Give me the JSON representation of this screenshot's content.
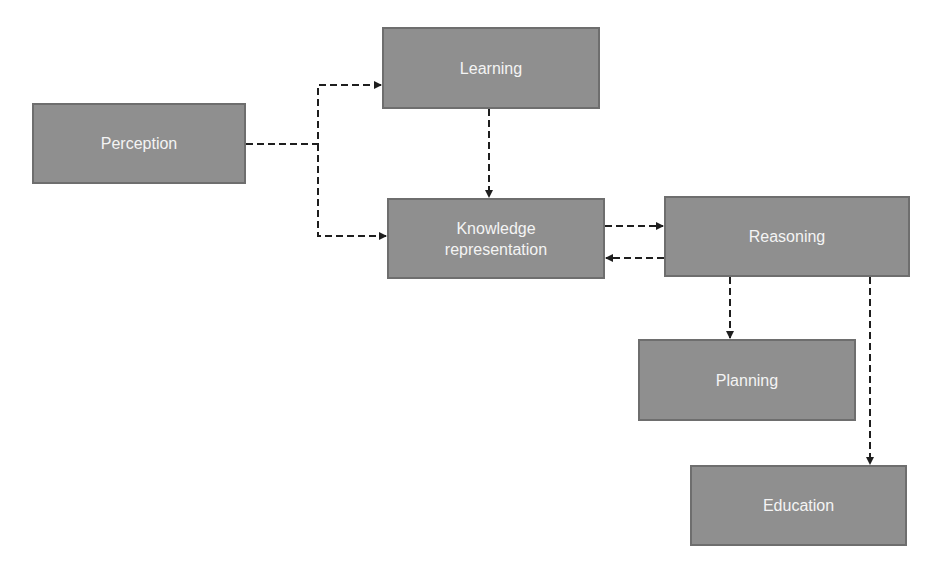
{
  "diagram": {
    "nodes": [
      {
        "id": "perception",
        "label": "Perception"
      },
      {
        "id": "learning",
        "label": "Learning"
      },
      {
        "id": "knowledge_representation",
        "label": "Knowledge\nrepresentation"
      },
      {
        "id": "reasoning",
        "label": "Reasoning"
      },
      {
        "id": "planning",
        "label": "Planning"
      },
      {
        "id": "education",
        "label": "Education"
      }
    ],
    "edges": [
      {
        "from": "Perception",
        "to": "Learning",
        "style": "dashed"
      },
      {
        "from": "Perception",
        "to": "Knowledge representation",
        "style": "dashed"
      },
      {
        "from": "Learning",
        "to": "Knowledge representation",
        "style": "dashed"
      },
      {
        "from": "Knowledge representation",
        "to": "Reasoning",
        "style": "dashed"
      },
      {
        "from": "Reasoning",
        "to": "Knowledge representation",
        "style": "dashed"
      },
      {
        "from": "Reasoning",
        "to": "Planning",
        "style": "dashed"
      },
      {
        "from": "Reasoning",
        "to": "Education",
        "style": "dashed"
      }
    ],
    "colors": {
      "node_fill": "#8f8f8f",
      "node_border": "#6e6e6e",
      "node_text": "#f4f4f4",
      "edge": "#1e1e1e"
    }
  }
}
